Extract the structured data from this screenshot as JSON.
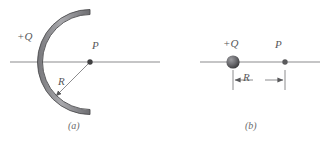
{
  "figure": {
    "background_color": "#ffffff",
    "line_color": "#8c8c8e",
    "band_fill_color": "#9a9a9c",
    "band_edge_color": "#4d4d4f",
    "label_color": "#58585a",
    "width": 335,
    "height": 143
  },
  "panel_a": {
    "caption": "(a)",
    "charge_label": "+Q",
    "point_label": "P",
    "radius_label": "R",
    "description": "semicircular charged rod of charge +Q opening to the right, with field point P at the center of curvature and radius R",
    "axis": {
      "x1": 10,
      "y": 62,
      "x2": 160
    },
    "arc": {
      "center_x": 90,
      "center_y": 62,
      "radius": 50,
      "band_thickness": 5,
      "start_deg": 90,
      "end_deg": 270
    },
    "point_p": {
      "x": 90,
      "y": 62,
      "dot_radius": 2.6
    },
    "radius_arrow": {
      "from_x": 90,
      "from_y": 62,
      "to_x": 55,
      "to_y": 97
    }
  },
  "panel_b": {
    "caption": "(b)",
    "charge_label": "+Q",
    "point_label": "P",
    "radius_label": "R",
    "description": "point charge +Q on a horizontal line with field point P a distance R to the right",
    "axis": {
      "x1": 35,
      "y": 62,
      "x2": 155
    },
    "charge": {
      "x": 68,
      "y": 62,
      "radius": 6.5
    },
    "point_p": {
      "x": 120,
      "y": 62,
      "dot_radius": 2.6
    },
    "dimension": {
      "x1": 68,
      "x2": 120,
      "y": 80,
      "tick_top": 70,
      "tick_bottom": 90
    }
  }
}
